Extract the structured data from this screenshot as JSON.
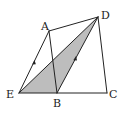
{
  "diagram": {
    "type": "geometry",
    "colors": {
      "stroke": "#222222",
      "shade": "#bdbdbd",
      "background": "#ffffff"
    },
    "points": {
      "A": {
        "label": "A",
        "x": 49,
        "y": 31
      },
      "B": {
        "label": "B",
        "x": 57,
        "y": 93
      },
      "C": {
        "label": "C",
        "x": 107,
        "y": 93
      },
      "D": {
        "label": "D",
        "x": 98,
        "y": 17
      },
      "E": {
        "label": "E",
        "x": 19,
        "y": 93
      }
    },
    "segments": [
      "EA",
      "AD",
      "AB",
      "DC",
      "EC",
      "ED",
      "BD"
    ],
    "shaded_region": [
      "E",
      "B",
      "D"
    ],
    "parallel_marks": [
      "EA",
      "BD"
    ]
  }
}
